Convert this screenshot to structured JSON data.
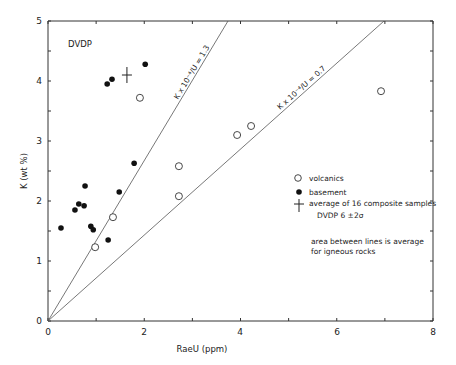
{
  "chart_data": {
    "type": "scatter",
    "title": "DVDP",
    "xlabel": "RaeU (ppm)",
    "ylabel": "K (wt %)",
    "xlim": [
      0,
      8
    ],
    "ylim": [
      0,
      5
    ],
    "x_ticks": [
      "0",
      "2",
      "4",
      "6",
      "8"
    ],
    "y_ticks": [
      "0",
      "1",
      "2",
      "3",
      "4",
      "5"
    ],
    "grid": false,
    "legend_position": "right-middle",
    "series": [
      {
        "name": "volcanics",
        "marker": "open-circle",
        "points": [
          [
            0.98,
            1.23
          ],
          [
            1.35,
            1.73
          ],
          [
            1.91,
            3.72
          ],
          [
            2.72,
            2.58
          ],
          [
            2.72,
            2.08
          ],
          [
            3.93,
            3.1
          ],
          [
            4.22,
            3.25
          ],
          [
            6.92,
            3.83
          ]
        ]
      },
      {
        "name": "basement",
        "marker": "filled-circle",
        "points": [
          [
            0.27,
            1.55
          ],
          [
            0.56,
            1.85
          ],
          [
            0.64,
            1.95
          ],
          [
            0.75,
            1.92
          ],
          [
            0.77,
            2.25
          ],
          [
            0.89,
            1.58
          ],
          [
            0.94,
            1.52
          ],
          [
            1.25,
            1.35
          ],
          [
            1.48,
            2.15
          ],
          [
            1.79,
            2.63
          ],
          [
            1.23,
            3.95
          ],
          [
            1.33,
            4.03
          ],
          [
            2.02,
            4.28
          ]
        ]
      },
      {
        "name": "average of 16 composite samples",
        "marker": "cross",
        "points": [
          [
            1.64,
            4.1
          ]
        ]
      }
    ],
    "reference_lines": [
      {
        "label": "K x 10⁻⁴/U = 1.3",
        "slope": 1.3
      },
      {
        "label": "K x 10⁻⁴/U = 0.7",
        "slope": 0.7
      }
    ],
    "annotations": [
      "DVDP 6   ±2σ",
      "area between lines is average",
      "for igneous rocks"
    ]
  },
  "legend": {
    "volcanics": "volcanics",
    "basement": "basement",
    "average": "average of 16 composite samples",
    "sigma_note": "DVDP 6   ±2σ"
  },
  "notes": {
    "line1": "area between lines is average",
    "line2": "for igneous rocks"
  },
  "lines": {
    "steep_label": "K x 10⁻⁴/U = 1.3",
    "shallow_label": "K x 10⁻⁴/U = 0.7"
  },
  "axes": {
    "xlabel": "RaeU (ppm)",
    "ylabel": "K (wt %)",
    "title": "DVDP",
    "x_ticks": [
      "0",
      "2",
      "4",
      "6",
      "8"
    ],
    "y_ticks": [
      "0",
      "1",
      "2",
      "3",
      "4",
      "5"
    ]
  }
}
